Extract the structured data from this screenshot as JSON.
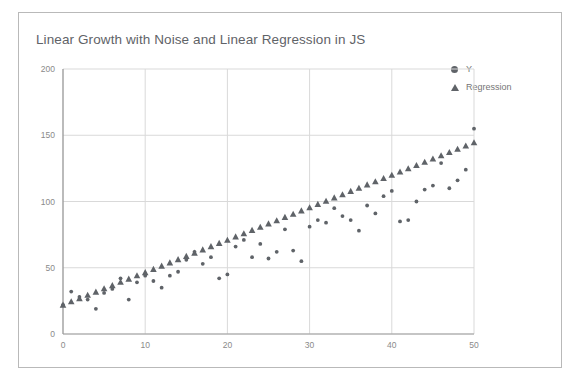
{
  "card": {
    "background": "#ffffff",
    "border_color": "#b9b9b9"
  },
  "chart_data": {
    "type": "scatter",
    "title": "Linear Growth with Noise and Linear Regression in JS",
    "xlabel": "",
    "ylabel": "",
    "xlim": [
      0,
      50
    ],
    "ylim": [
      0,
      200
    ],
    "xticks": [
      0,
      10,
      20,
      30,
      40,
      50
    ],
    "yticks": [
      0,
      50,
      100,
      150,
      200
    ],
    "grid": true,
    "legend_position": "top-right",
    "marker_color": "#5f6368",
    "grid_color": "#d9d9d9",
    "axis_color": "#9e9e9e",
    "legend": [
      {
        "name": "Y",
        "marker": "circle"
      },
      {
        "name": "Regression",
        "marker": "triangle"
      }
    ],
    "series": [
      {
        "name": "Y",
        "marker": "circle",
        "x": [
          0,
          1,
          2,
          3,
          4,
          5,
          6,
          7,
          8,
          9,
          10,
          11,
          12,
          13,
          14,
          15,
          16,
          17,
          18,
          19,
          20,
          21,
          22,
          23,
          24,
          25,
          26,
          27,
          28,
          29,
          30,
          31,
          32,
          33,
          34,
          35,
          36,
          37,
          38,
          39,
          40,
          41,
          42,
          43,
          44,
          45,
          46,
          47,
          48,
          49,
          50
        ],
        "values": [
          22,
          32,
          28,
          26,
          19,
          31,
          34,
          42,
          26,
          39,
          44,
          40,
          35,
          44,
          47,
          56,
          62,
          53,
          58,
          42,
          45,
          66,
          71,
          58,
          68,
          57,
          62,
          79,
          63,
          55,
          81,
          86,
          84,
          95,
          89,
          86,
          78,
          97,
          91,
          104,
          108,
          85,
          86,
          100,
          109,
          112,
          129,
          110,
          116,
          124,
          155
        ]
      },
      {
        "name": "Regression",
        "marker": "triangle",
        "x": [
          0,
          1,
          2,
          3,
          4,
          5,
          6,
          7,
          8,
          9,
          10,
          11,
          12,
          13,
          14,
          15,
          16,
          17,
          18,
          19,
          20,
          21,
          22,
          23,
          24,
          25,
          26,
          27,
          28,
          29,
          30,
          31,
          32,
          33,
          34,
          35,
          36,
          37,
          38,
          39,
          40,
          41,
          42,
          43,
          44,
          45,
          46,
          47,
          48,
          49,
          50
        ],
        "values": [
          22.0,
          24.5,
          26.9,
          29.4,
          31.8,
          34.3,
          36.7,
          39.2,
          41.6,
          44.1,
          46.5,
          49.0,
          51.4,
          53.9,
          56.3,
          58.8,
          61.2,
          63.7,
          66.1,
          68.6,
          71.0,
          73.5,
          75.9,
          78.4,
          80.8,
          83.3,
          85.7,
          88.2,
          90.6,
          93.1,
          95.5,
          98.0,
          100.4,
          102.9,
          105.3,
          107.8,
          110.2,
          112.7,
          115.1,
          117.6,
          120.0,
          122.5,
          124.9,
          127.4,
          129.8,
          132.3,
          134.7,
          137.2,
          139.6,
          142.1,
          144.5
        ]
      }
    ]
  }
}
